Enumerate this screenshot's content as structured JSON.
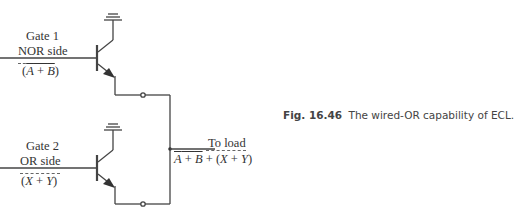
{
  "diagram": {
    "gate1": {
      "title": "Gate 1",
      "side_label": "NOR side",
      "expr_open": "(",
      "expr_a": "A",
      "expr_plus": " + ",
      "expr_b": "B",
      "expr_close": ")"
    },
    "gate2": {
      "title": "Gate 2",
      "side_label": "OR side",
      "expr_open": "(",
      "expr_x": "X",
      "expr_plus": " + ",
      "expr_y": "Y",
      "expr_close": ")"
    },
    "output": {
      "label": "To load",
      "expr_a": "A",
      "expr_plus1": " + ",
      "expr_b": "B",
      "expr_plus2": " + (",
      "expr_x": "X",
      "expr_plus3": " + ",
      "expr_y": "Y",
      "expr_close": ")"
    }
  },
  "caption": {
    "figure_number": "Fig. 16.46",
    "text": "The wired-OR capability of ECL."
  }
}
